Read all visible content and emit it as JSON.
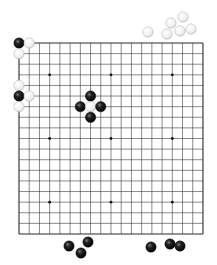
{
  "board": {
    "size": 19,
    "origin_px": [
      19,
      43
    ],
    "spacing_px": [
      10.22,
      10.61
    ],
    "line_color": "#3a3a3a",
    "border_color": "#2a2a2a",
    "star_points": [
      [
        3,
        3
      ],
      [
        9,
        3
      ],
      [
        15,
        3
      ],
      [
        3,
        9
      ],
      [
        9,
        9
      ],
      [
        15,
        9
      ],
      [
        3,
        15
      ],
      [
        9,
        15
      ],
      [
        15,
        15
      ]
    ]
  },
  "stones_on_board": [
    {
      "color": "black",
      "col": 0,
      "row": 0
    },
    {
      "color": "white",
      "col": 1,
      "row": 0
    },
    {
      "color": "white",
      "col": 0,
      "row": 1
    },
    {
      "color": "white",
      "col": 0,
      "row": 4
    },
    {
      "color": "black",
      "col": 0,
      "row": 5
    },
    {
      "color": "white",
      "col": 1,
      "row": 5
    },
    {
      "color": "white",
      "col": 0,
      "row": 6
    },
    {
      "color": "black",
      "col": 7,
      "row": 5
    },
    {
      "color": "black",
      "col": 6,
      "row": 6
    },
    {
      "color": "white",
      "col": 7,
      "row": 6
    },
    {
      "color": "black",
      "col": 8,
      "row": 6
    },
    {
      "color": "black",
      "col": 7,
      "row": 7
    }
  ],
  "stones_off_board": [
    {
      "color": "white",
      "x": 148,
      "y": 32
    },
    {
      "color": "white",
      "x": 171,
      "y": 23
    },
    {
      "color": "white",
      "x": 167,
      "y": 34
    },
    {
      "color": "white",
      "x": 183,
      "y": 17
    },
    {
      "color": "white",
      "x": 180,
      "y": 31
    },
    {
      "color": "white",
      "x": 191,
      "y": 29
    },
    {
      "color": "black",
      "x": 69,
      "y": 246
    },
    {
      "color": "black",
      "x": 88,
      "y": 242
    },
    {
      "color": "black",
      "x": 81,
      "y": 253
    },
    {
      "color": "black",
      "x": 151,
      "y": 247
    },
    {
      "color": "black",
      "x": 170,
      "y": 244
    },
    {
      "color": "black",
      "x": 180,
      "y": 246
    }
  ],
  "stone_radius_px": 5.2,
  "colors": {
    "black_stone": "#111111",
    "black_highlight": "#6a6a6a",
    "white_stone": "#f4f4f4",
    "white_edge": "#bdbdbd",
    "background": "#ffffff"
  }
}
